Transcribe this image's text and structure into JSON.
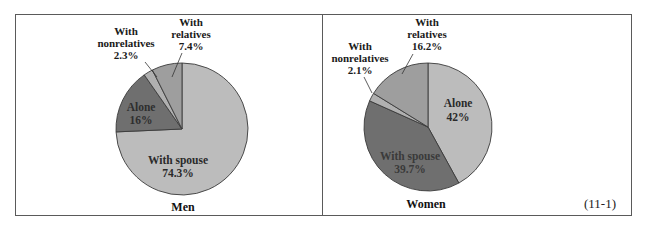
{
  "figure_number": "(11-1)",
  "colors": {
    "light": "#bcbcbc",
    "dark": "#6f6f6f",
    "mid": "#9e9e9e",
    "thin": "#b0b0b0",
    "stroke": "#3a3a3a"
  },
  "chart_data": [
    {
      "type": "pie",
      "title": "Men",
      "start_angle": "12 o'clock, clockwise",
      "categories": [
        "With spouse",
        "Alone",
        "With nonrelatives",
        "With relatives"
      ],
      "values": [
        74.3,
        16,
        2.3,
        7.4
      ],
      "labels": [
        "With spouse 74.3%",
        "Alone 16%",
        "With nonrelatives 2.3%",
        "With relatives 7.4%"
      ]
    },
    {
      "type": "pie",
      "title": "Women",
      "start_angle": "12 o'clock, clockwise",
      "categories": [
        "Alone",
        "With spouse",
        "With nonrelatives",
        "With relatives"
      ],
      "values": [
        42,
        39.7,
        2.1,
        16.2
      ],
      "labels": [
        "Alone 42%",
        "With spouse 39.7%",
        "With nonrelatives 2.1%",
        "With relatives 16.2%"
      ]
    }
  ],
  "men": {
    "caption": "Men",
    "spouse": {
      "name": "With spouse",
      "pct": "74.3%"
    },
    "alone": {
      "name": "Alone",
      "pct": "16%"
    },
    "nonrel": {
      "line1": "With",
      "line2": "nonrelatives",
      "pct": "2.3%"
    },
    "rel": {
      "line1": "With",
      "line2": "relatives",
      "pct": "7.4%"
    }
  },
  "women": {
    "caption": "Women",
    "alone": {
      "name": "Alone",
      "pct": "42%"
    },
    "spouse": {
      "name": "With spouse",
      "pct": "39.7%"
    },
    "nonrel": {
      "line1": "With",
      "line2": "nonrelatives",
      "pct": "2.1%"
    },
    "rel": {
      "line1": "With",
      "line2": "relatives",
      "pct": "16.2%"
    }
  }
}
